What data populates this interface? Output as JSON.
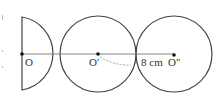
{
  "diagram": {
    "points": [
      {
        "id": "O",
        "label": "O"
      },
      {
        "id": "O1",
        "label": "O′"
      },
      {
        "id": "O2",
        "label": "O″"
      }
    ],
    "measurement": {
      "label": "8 cm",
      "between": [
        "O1",
        "tangent-point"
      ]
    }
  }
}
